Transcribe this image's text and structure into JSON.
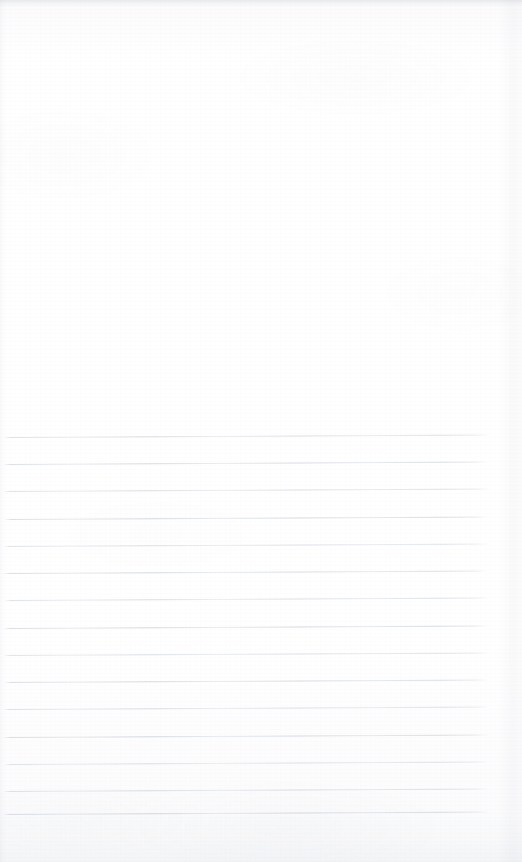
{
  "document": {
    "kind": "scanned-lined-notebook-page",
    "title": "Blank ruled page",
    "page_width": 522,
    "page_height": 862,
    "background_color": "#fdfdfe",
    "rule_color": "#ced3da",
    "text_content": "",
    "has_handwriting": false,
    "has_printed_text": false
  },
  "regions": {
    "blank_area": {
      "label": "Blank unruled upper area",
      "top": 0,
      "height": 430
    },
    "ruled_area": {
      "label": "Ruled writing area",
      "top": 430,
      "height": 432,
      "line_count": 15,
      "line_spacing": 27,
      "first_line_y": 437,
      "last_line_y": 814,
      "left_margin": 3,
      "right_margin": 32
    }
  },
  "scan_artifacts": {
    "top_edge_shadow": true,
    "right_page_edge": true,
    "left_edge_shadow": true,
    "bottom_haze": true,
    "skew_degrees": -0.3,
    "paper_texture": "fine horizontal fibre grain"
  },
  "rules": [
    {
      "index": 1,
      "y": 437,
      "x_start": 4,
      "x_end": 490,
      "opacity": 0.8
    },
    {
      "index": 2,
      "y": 464,
      "x_start": 3,
      "x_end": 489,
      "opacity": 0.86
    },
    {
      "index": 3,
      "y": 491,
      "x_start": 3,
      "x_end": 490,
      "opacity": 0.78
    },
    {
      "index": 4,
      "y": 519,
      "x_start": 4,
      "x_end": 489,
      "opacity": 0.88
    },
    {
      "index": 5,
      "y": 546,
      "x_start": 3,
      "x_end": 490,
      "opacity": 0.74
    },
    {
      "index": 6,
      "y": 573,
      "x_start": 3,
      "x_end": 489,
      "opacity": 0.84
    },
    {
      "index": 7,
      "y": 600,
      "x_start": 4,
      "x_end": 490,
      "opacity": 0.79
    },
    {
      "index": 8,
      "y": 628,
      "x_start": 3,
      "x_end": 489,
      "opacity": 0.9
    },
    {
      "index": 9,
      "y": 655,
      "x_start": 3,
      "x_end": 490,
      "opacity": 0.76
    },
    {
      "index": 10,
      "y": 682,
      "x_start": 4,
      "x_end": 489,
      "opacity": 0.85
    },
    {
      "index": 11,
      "y": 709,
      "x_start": 3,
      "x_end": 490,
      "opacity": 0.8
    },
    {
      "index": 12,
      "y": 737,
      "x_start": 3,
      "x_end": 489,
      "opacity": 0.88
    },
    {
      "index": 13,
      "y": 764,
      "x_start": 4,
      "x_end": 490,
      "opacity": 0.77
    },
    {
      "index": 14,
      "y": 791,
      "x_start": 3,
      "x_end": 489,
      "opacity": 0.83
    },
    {
      "index": 15,
      "y": 814,
      "x_start": 3,
      "x_end": 490,
      "opacity": 0.92
    }
  ]
}
